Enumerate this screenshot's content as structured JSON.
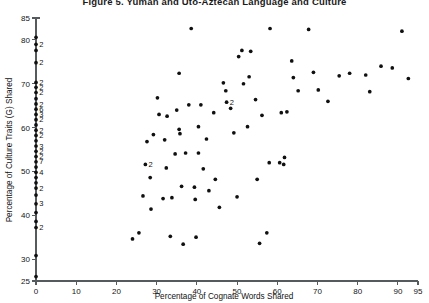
{
  "figure": {
    "title": "Figure 5.  Yuman and Uto-Aztecan Language and Culture"
  },
  "axes": {
    "x_title": "Percentage of Cognate Words Shared",
    "y_title": "Percentage of Culture Traits (G) Shared",
    "x_ticks": [
      "0",
      "10",
      "20",
      "30",
      "40",
      "50",
      "60",
      "70",
      "80",
      "90",
      "95"
    ],
    "y_ticks": [
      "25",
      "30",
      "40",
      "50",
      "60",
      "70",
      "80",
      "85"
    ]
  },
  "chart_data": {
    "type": "scatter",
    "title": "Figure 5.  Yuman and Uto-Aztecan Language and Culture",
    "xlabel": "Percentage of Cognate Words Shared",
    "ylabel": "Percentage of Culture Traits (G) Shared",
    "xlim": [
      0,
      95
    ],
    "ylim": [
      25,
      85
    ],
    "xticks": [
      0,
      10,
      20,
      30,
      40,
      50,
      60,
      70,
      80,
      90,
      95
    ],
    "yticks": [
      25,
      30,
      40,
      50,
      60,
      70,
      80,
      85
    ],
    "grid": false,
    "legend": null,
    "marker": "filled-circle",
    "marker_color": "#101010",
    "note": "Integer labels next to a point denote that many coincident observations at that location.",
    "points": [
      {
        "x": 0,
        "y": 80.6,
        "n": 1
      },
      {
        "x": 0,
        "y": 79.0,
        "n": 2
      },
      {
        "x": 0,
        "y": 77.6,
        "n": 1
      },
      {
        "x": 0,
        "y": 74.8,
        "n": 2
      },
      {
        "x": 0,
        "y": 70.3,
        "n": 2
      },
      {
        "x": 0,
        "y": 69.2,
        "n": 2
      },
      {
        "x": 0,
        "y": 68.0,
        "n": 2
      },
      {
        "x": 0,
        "y": 66.6,
        "n": 1
      },
      {
        "x": 0,
        "y": 65.4,
        "n": 2
      },
      {
        "x": 0,
        "y": 64.2,
        "n": 6
      },
      {
        "x": 0,
        "y": 63.0,
        "n": 3
      },
      {
        "x": 0,
        "y": 61.8,
        "n": 2
      },
      {
        "x": 0,
        "y": 60.6,
        "n": 1
      },
      {
        "x": 0,
        "y": 59.4,
        "n": 2
      },
      {
        "x": 0,
        "y": 58.2,
        "n": 2
      },
      {
        "x": 0,
        "y": 57.0,
        "n": 1
      },
      {
        "x": 0,
        "y": 55.8,
        "n": 3
      },
      {
        "x": 0,
        "y": 54.6,
        "n": 2
      },
      {
        "x": 0,
        "y": 53.4,
        "n": 2
      },
      {
        "x": 0,
        "y": 52.2,
        "n": 7
      },
      {
        "x": 0,
        "y": 51.0,
        "n": 1
      },
      {
        "x": 0,
        "y": 49.8,
        "n": 4
      },
      {
        "x": 0,
        "y": 48.6,
        "n": 1
      },
      {
        "x": 0,
        "y": 47.4,
        "n": 1
      },
      {
        "x": 0,
        "y": 46.2,
        "n": 2
      },
      {
        "x": 0,
        "y": 44.6,
        "n": 1
      },
      {
        "x": 0,
        "y": 42.6,
        "n": 3
      },
      {
        "x": 0,
        "y": 40.6,
        "n": 1
      },
      {
        "x": 0,
        "y": 38.6,
        "n": 1
      },
      {
        "x": 0,
        "y": 37.2,
        "n": 2
      },
      {
        "x": 0,
        "y": 30.8,
        "n": 1
      },
      {
        "x": 0,
        "y": 26.0,
        "n": 1
      },
      {
        "x": 24.0,
        "y": 34.6,
        "n": 1
      },
      {
        "x": 25.6,
        "y": 36.0,
        "n": 1
      },
      {
        "x": 26.6,
        "y": 44.4,
        "n": 1
      },
      {
        "x": 27.2,
        "y": 51.6,
        "n": 2
      },
      {
        "x": 27.6,
        "y": 56.8,
        "n": 1
      },
      {
        "x": 28.4,
        "y": 48.6,
        "n": 1
      },
      {
        "x": 28.6,
        "y": 41.4,
        "n": 1
      },
      {
        "x": 29.2,
        "y": 58.4,
        "n": 1
      },
      {
        "x": 30.2,
        "y": 66.8,
        "n": 1
      },
      {
        "x": 30.6,
        "y": 63.0,
        "n": 1
      },
      {
        "x": 31.6,
        "y": 43.8,
        "n": 1
      },
      {
        "x": 32.0,
        "y": 57.2,
        "n": 1
      },
      {
        "x": 32.4,
        "y": 50.8,
        "n": 1
      },
      {
        "x": 32.6,
        "y": 62.6,
        "n": 1
      },
      {
        "x": 33.4,
        "y": 35.2,
        "n": 1
      },
      {
        "x": 33.8,
        "y": 44.0,
        "n": 1
      },
      {
        "x": 34.6,
        "y": 54.0,
        "n": 1
      },
      {
        "x": 35.0,
        "y": 64.0,
        "n": 1
      },
      {
        "x": 35.6,
        "y": 72.4,
        "n": 1
      },
      {
        "x": 35.6,
        "y": 59.6,
        "n": 1
      },
      {
        "x": 35.8,
        "y": 58.6,
        "n": 1
      },
      {
        "x": 36.2,
        "y": 46.6,
        "n": 1
      },
      {
        "x": 36.6,
        "y": 33.4,
        "n": 1
      },
      {
        "x": 37.2,
        "y": 54.2,
        "n": 1
      },
      {
        "x": 38.0,
        "y": 65.2,
        "n": 1
      },
      {
        "x": 38.6,
        "y": 82.6,
        "n": 1
      },
      {
        "x": 39.4,
        "y": 46.4,
        "n": 1
      },
      {
        "x": 39.6,
        "y": 43.6,
        "n": 1
      },
      {
        "x": 39.8,
        "y": 35.0,
        "n": 1
      },
      {
        "x": 40.4,
        "y": 54.2,
        "n": 1
      },
      {
        "x": 40.4,
        "y": 60.2,
        "n": 1
      },
      {
        "x": 41.0,
        "y": 65.2,
        "n": 1
      },
      {
        "x": 41.6,
        "y": 50.6,
        "n": 1
      },
      {
        "x": 42.4,
        "y": 57.4,
        "n": 1
      },
      {
        "x": 43.0,
        "y": 45.6,
        "n": 1
      },
      {
        "x": 44.2,
        "y": 63.4,
        "n": 1
      },
      {
        "x": 44.6,
        "y": 48.2,
        "n": 1
      },
      {
        "x": 45.6,
        "y": 41.8,
        "n": 1
      },
      {
        "x": 46.6,
        "y": 70.2,
        "n": 1
      },
      {
        "x": 47.2,
        "y": 68.4,
        "n": 1
      },
      {
        "x": 47.4,
        "y": 65.8,
        "n": 2
      },
      {
        "x": 48.4,
        "y": 64.4,
        "n": 1
      },
      {
        "x": 49.2,
        "y": 58.8,
        "n": 1
      },
      {
        "x": 50.0,
        "y": 44.2,
        "n": 1
      },
      {
        "x": 50.4,
        "y": 76.2,
        "n": 1
      },
      {
        "x": 51.2,
        "y": 77.6,
        "n": 1
      },
      {
        "x": 51.6,
        "y": 70.0,
        "n": 1
      },
      {
        "x": 52.6,
        "y": 60.2,
        "n": 1
      },
      {
        "x": 53.0,
        "y": 71.6,
        "n": 1
      },
      {
        "x": 53.4,
        "y": 77.4,
        "n": 1
      },
      {
        "x": 54.6,
        "y": 66.4,
        "n": 1
      },
      {
        "x": 55.0,
        "y": 48.2,
        "n": 1
      },
      {
        "x": 55.6,
        "y": 33.6,
        "n": 1
      },
      {
        "x": 56.2,
        "y": 62.8,
        "n": 1
      },
      {
        "x": 57.4,
        "y": 36.0,
        "n": 1
      },
      {
        "x": 58.0,
        "y": 52.0,
        "n": 1
      },
      {
        "x": 58.2,
        "y": 82.6,
        "n": 1
      },
      {
        "x": 60.6,
        "y": 52.0,
        "n": 1
      },
      {
        "x": 61.6,
        "y": 51.6,
        "n": 1
      },
      {
        "x": 61.8,
        "y": 53.2,
        "n": 1
      },
      {
        "x": 61.0,
        "y": 63.4,
        "n": 1
      },
      {
        "x": 62.4,
        "y": 63.6,
        "n": 1
      },
      {
        "x": 63.6,
        "y": 75.2,
        "n": 1
      },
      {
        "x": 64.0,
        "y": 71.4,
        "n": 1
      },
      {
        "x": 65.2,
        "y": 68.4,
        "n": 1
      },
      {
        "x": 67.8,
        "y": 82.4,
        "n": 1
      },
      {
        "x": 69.0,
        "y": 72.6,
        "n": 1
      },
      {
        "x": 70.2,
        "y": 68.6,
        "n": 1
      },
      {
        "x": 72.6,
        "y": 66.0,
        "n": 1
      },
      {
        "x": 75.4,
        "y": 71.8,
        "n": 1
      },
      {
        "x": 78.0,
        "y": 72.4,
        "n": 1
      },
      {
        "x": 82.0,
        "y": 72.0,
        "n": 1
      },
      {
        "x": 83.0,
        "y": 68.2,
        "n": 1
      },
      {
        "x": 85.8,
        "y": 74.0,
        "n": 1
      },
      {
        "x": 88.6,
        "y": 73.6,
        "n": 1
      },
      {
        "x": 91.0,
        "y": 82.0,
        "n": 1
      },
      {
        "x": 92.6,
        "y": 71.2,
        "n": 1
      }
    ]
  }
}
